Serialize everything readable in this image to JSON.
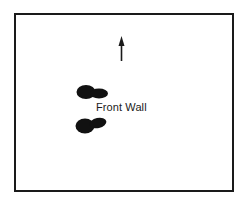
{
  "diagram": {
    "label": "Front Wall",
    "elements": [
      {
        "type": "frame",
        "description": "rectangular border"
      },
      {
        "type": "arrow",
        "direction": "up"
      },
      {
        "type": "footprint",
        "position": "upper",
        "pointing": "right"
      },
      {
        "type": "footprint",
        "position": "lower",
        "pointing": "right"
      }
    ],
    "colors": {
      "ink": "#1a1a1a",
      "background": "#ffffff"
    }
  }
}
